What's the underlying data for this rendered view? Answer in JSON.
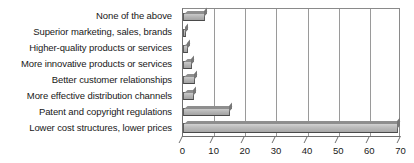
{
  "chart_data": {
    "type": "bar",
    "orientation": "horizontal",
    "title": "",
    "xlabel": "",
    "ylabel": "",
    "xlim": [
      0,
      70
    ],
    "xticks": [
      0,
      10,
      20,
      30,
      40,
      50,
      60,
      70
    ],
    "grid": "vertical",
    "legend": "none",
    "categories": [
      "None of the above",
      "Superior marketing, sales, brands",
      "Higher-quality products or services",
      "More innovative products or services",
      "Better customer relationships",
      "More effective distribution channels",
      "Patent and copyright regulations",
      "Lower cost structures, lower prices"
    ],
    "values": [
      7,
      1,
      1.5,
      3,
      4,
      3.5,
      15,
      69
    ],
    "bar_color": "#b6b6b6",
    "bar_edge_color": "#5d5d5d",
    "axis_color": "#6f6f6f",
    "grid_color": "#9a9a9a",
    "background": "#ffffff"
  }
}
